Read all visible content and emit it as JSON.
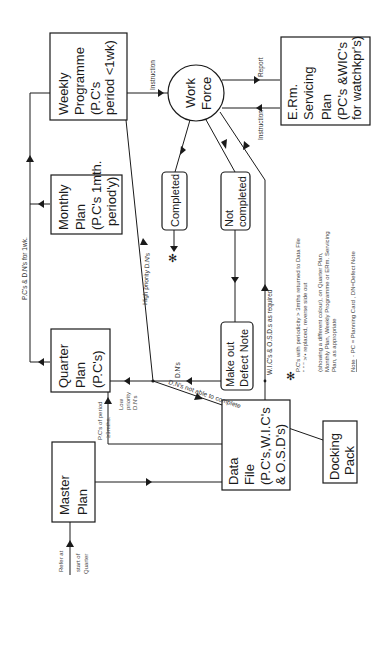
{
  "diagram": {
    "orientation": "rotated -90deg (landscape figure printed sideways)",
    "nodes": {
      "weekly_programme": {
        "lines": [
          "Weekly",
          "Programme",
          "(P.C's",
          "period <1wk)"
        ]
      },
      "work_force": {
        "lines": [
          "Work",
          "Force"
        ]
      },
      "erm_servicing_plan": {
        "lines": [
          "E.Rm.",
          "Servicing",
          "Plan",
          "(PC's &WIC's",
          "for watchkpr's)"
        ]
      },
      "monthly_plan": {
        "lines": [
          "Monthly",
          "Plan",
          "(P.C's 1mth.",
          "period'y)"
        ]
      },
      "quarter_plan": {
        "lines": [
          "Quarter",
          "Plan",
          "(P.C's)"
        ]
      },
      "completed": {
        "lines": [
          "Completed"
        ]
      },
      "not_completed": {
        "lines": [
          "Not",
          "completed"
        ]
      },
      "defect_note": {
        "lines": [
          "Make out",
          "Defect Note"
        ]
      },
      "master_plan": {
        "lines": [
          "Master",
          "Plan"
        ]
      },
      "data_file": {
        "lines": [
          "Data",
          "File",
          "(P.C's,W.I.C's",
          "& O.S.D's)"
        ]
      },
      "docking_pack": {
        "lines": [
          "Docking",
          "Pack"
        ]
      }
    },
    "edge_labels": {
      "instruction_weekly": "Instruction",
      "report": "Report",
      "instruction_erm": "Instruction",
      "pcs_dns_for_wk": "P.C's & D.N's for 1wk.",
      "high_priority": "High priority D.N's",
      "dns": "D.N's",
      "low_priority": [
        "Low",
        "priority",
        "D.N's"
      ],
      "pcs_of_period": [
        "P.C's of period",
        "≥3mths."
      ],
      "dns_not_able": "D.N's not able to complete",
      "wics_osds": "W.I.C's & O.S.D.s as required",
      "refer_at": [
        "Refer at",
        "start of",
        "Quarter"
      ]
    },
    "legend": {
      "symbol": "✻",
      "lines": [
        "P.C's with periodicity > 3mths returned to Data File",
        "  \"      \"        \"       ≯   • replaced, reverse side out",
        "(showing a different colour), on Quarter Plan,",
        "Monthly Plan, Weekly Programme or ERm. Servicing",
        "Plan, as appropriate"
      ],
      "note_label": "Note",
      "note_text": "- PC = Planning Card , DN=Defect Note"
    }
  }
}
